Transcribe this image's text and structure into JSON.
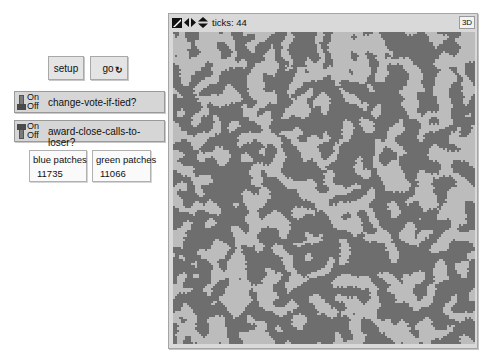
{
  "buttons": {
    "setup": {
      "label": "setup"
    },
    "go": {
      "label": "go",
      "forever_icon": "forever-icon",
      "forever_glyph": "↻"
    }
  },
  "switches": [
    {
      "name": "change-vote-if-tied?",
      "on_label": "On",
      "off_label": "Off",
      "state": "off"
    },
    {
      "name": "award-close-calls-to-loser?",
      "on_label": "On",
      "off_label": "Off",
      "state": "on"
    }
  ],
  "monitors": [
    {
      "label": "blue patches",
      "value": "11735"
    },
    {
      "label": "green patches",
      "value": "11066"
    }
  ],
  "view": {
    "ticks_label": "ticks: 44",
    "button_3d": "3D",
    "toolbar_icons": [
      "edit-icon",
      "horizontal-wrap-icon",
      "vertical-wrap-icon"
    ],
    "colors": {
      "patch_a": "#6e6e6e",
      "patch_b": "#bcbcbc"
    },
    "grid": {
      "cols": 151,
      "rows": 151
    }
  }
}
